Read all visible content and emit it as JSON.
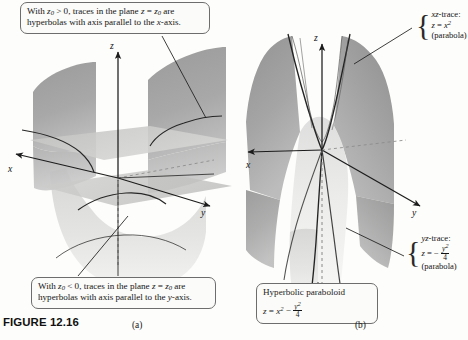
{
  "figure": {
    "caption_label": "FIGURE 12.16",
    "panel_a_letter": "(a)",
    "panel_b_letter": "(b)"
  },
  "callouts": {
    "top_left": {
      "line1_pre": "With ",
      "line1_var": "z",
      "line1_sub": "0",
      "line1_mid": " > 0, traces in the plane ",
      "line1_var2": "z",
      "line1_eq": " = ",
      "line1_var3": "z",
      "line1_sub2": "0",
      "line1_post": " are",
      "line2_pre": "hyperbolas with axis parallel to the ",
      "line2_var": "x",
      "line2_post": "-axis."
    },
    "bottom_left": {
      "line1_pre": "With ",
      "line1_var": "z",
      "line1_sub": "0",
      "line1_mid": " < 0, traces in the plane ",
      "line1_var2": "z",
      "line1_eq": " = ",
      "line1_var3": "z",
      "line1_sub2": "0",
      "line1_post": " are",
      "line2_pre": "hyperbolas with axis parallel to the ",
      "line2_var": "y",
      "line2_post": "-axis."
    }
  },
  "notes": {
    "xz_trace": {
      "brace": "{",
      "title_var": "xz",
      "title_rest": "-trace:",
      "eq_lhs": "z",
      "eq_mid": " = ",
      "eq_base": "x",
      "eq_exp": "2",
      "kind": "(parabola)"
    },
    "yz_trace": {
      "brace": "{",
      "title_var": "yz",
      "title_rest": "-trace:",
      "eq_lhs": "z",
      "eq_mid": " = − ",
      "frac_num": "y",
      "frac_num_exp": "2",
      "frac_den": "4",
      "kind": "(parabola)"
    }
  },
  "equation_box": {
    "title": "Hyperbolic paraboloid",
    "eq_lhs": "z",
    "eq_mid": " = ",
    "eq_term1": "x",
    "eq_term1_exp": "2",
    "eq_minus": " − ",
    "frac_num": "y",
    "frac_num_exp": "2",
    "frac_den": "4"
  },
  "axes": {
    "panel_a": {
      "x": "x",
      "y": "y",
      "z": "z"
    },
    "panel_b": {
      "x": "x",
      "y": "y",
      "z": "z"
    }
  },
  "colors": {
    "page_background": "#fdfdfb",
    "surface_dark": "#9a9a9a",
    "surface_mid": "#b4b4b4",
    "surface_light": "#d2d2d2",
    "surface_pale": "#e6e6e4",
    "plane_fill": "#c9c9c7",
    "axis_line": "#1c1c1c",
    "trace_line": "#2a2a2a",
    "callout_border": "#6d6d6d",
    "text": "#141414"
  }
}
